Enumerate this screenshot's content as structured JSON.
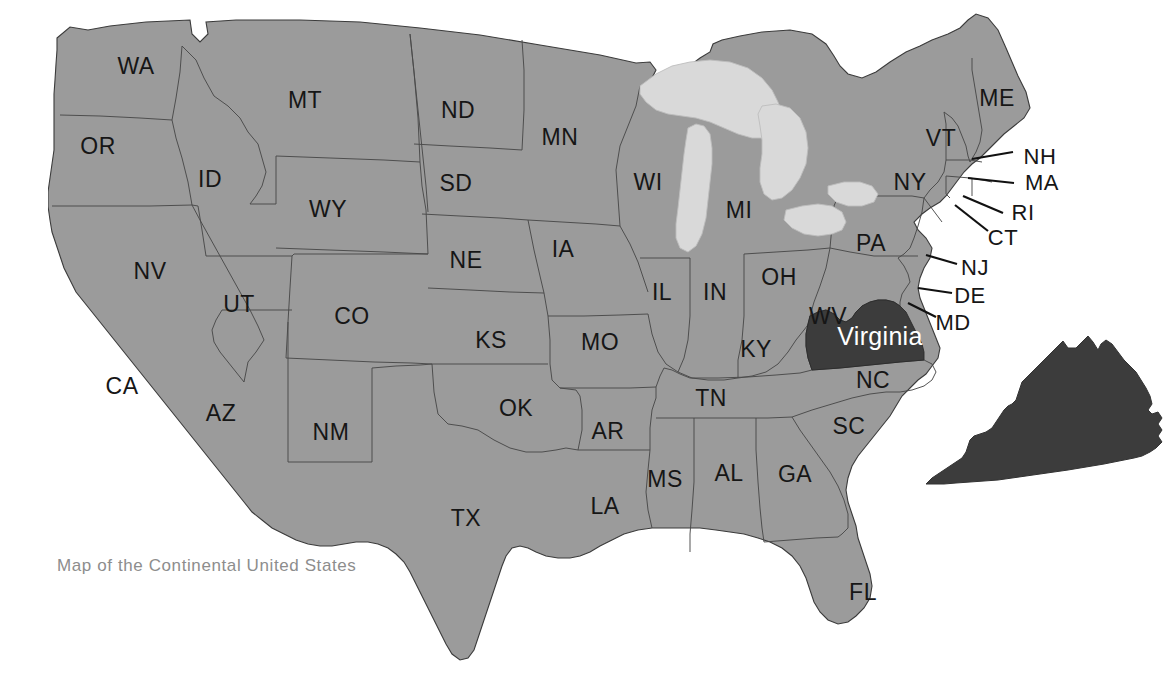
{
  "caption": {
    "text": "Map of the Continental United States",
    "x": 57,
    "y": 556
  },
  "colors": {
    "background": "#ffffff",
    "state_fill": "#9b9b9b",
    "state_border": "#4a4a4a",
    "outline": "#3b3b3b",
    "lake_fill": "#d9d9d9",
    "lake_border": "#bdbdbd",
    "highlight_fill": "#3c3c3c",
    "highlight_label": "#ffffff",
    "label_color": "#161616",
    "caption_color": "#8d8d8d",
    "leader_line": "#111111"
  },
  "highlight": {
    "state_code": "VA",
    "label": "Virginia",
    "label_x": 880,
    "label_y": 336,
    "inset_name": "virginia-inset"
  },
  "labels": [
    {
      "code": "WA",
      "x": 136,
      "y": 66
    },
    {
      "code": "OR",
      "x": 98,
      "y": 146
    },
    {
      "code": "ID",
      "x": 210,
      "y": 179
    },
    {
      "code": "MT",
      "x": 305,
      "y": 100
    },
    {
      "code": "WY",
      "x": 328,
      "y": 209
    },
    {
      "code": "ND",
      "x": 458,
      "y": 110
    },
    {
      "code": "SD",
      "x": 456,
      "y": 183
    },
    {
      "code": "NE",
      "x": 466,
      "y": 260
    },
    {
      "code": "MN",
      "x": 560,
      "y": 137
    },
    {
      "code": "IA",
      "x": 563,
      "y": 249
    },
    {
      "code": "WI",
      "x": 648,
      "y": 182
    },
    {
      "code": "MI",
      "x": 739,
      "y": 210
    },
    {
      "code": "NV",
      "x": 150,
      "y": 271
    },
    {
      "code": "UT",
      "x": 239,
      "y": 304
    },
    {
      "code": "CO",
      "x": 352,
      "y": 316
    },
    {
      "code": "KS",
      "x": 491,
      "y": 340
    },
    {
      "code": "MO",
      "x": 600,
      "y": 342
    },
    {
      "code": "IL",
      "x": 662,
      "y": 292
    },
    {
      "code": "IN",
      "x": 715,
      "y": 292
    },
    {
      "code": "OH",
      "x": 779,
      "y": 277
    },
    {
      "code": "PA",
      "x": 871,
      "y": 243
    },
    {
      "code": "NY",
      "x": 910,
      "y": 182
    },
    {
      "code": "VT",
      "x": 941,
      "y": 138
    },
    {
      "code": "ME",
      "x": 997,
      "y": 98
    },
    {
      "code": "CA",
      "x": 122,
      "y": 386
    },
    {
      "code": "AZ",
      "x": 221,
      "y": 413
    },
    {
      "code": "NM",
      "x": 331,
      "y": 432
    },
    {
      "code": "OK",
      "x": 516,
      "y": 408
    },
    {
      "code": "AR",
      "x": 608,
      "y": 431
    },
    {
      "code": "TN",
      "x": 711,
      "y": 398
    },
    {
      "code": "KY",
      "x": 756,
      "y": 349
    },
    {
      "code": "WV",
      "x": 828,
      "y": 316
    },
    {
      "code": "NC",
      "x": 873,
      "y": 380
    },
    {
      "code": "SC",
      "x": 849,
      "y": 426
    },
    {
      "code": "GA",
      "x": 795,
      "y": 474
    },
    {
      "code": "AL",
      "x": 729,
      "y": 473
    },
    {
      "code": "MS",
      "x": 665,
      "y": 479
    },
    {
      "code": "LA",
      "x": 605,
      "y": 506
    },
    {
      "code": "TX",
      "x": 466,
      "y": 518
    },
    {
      "code": "FL",
      "x": 863,
      "y": 592
    }
  ],
  "callout_labels": [
    {
      "code": "NH",
      "x": 1040,
      "y": 157,
      "line": {
        "x1": 972,
        "y1": 159,
        "x2": 1013,
        "y2": 152
      }
    },
    {
      "code": "MA",
      "x": 1042,
      "y": 183,
      "line": {
        "x1": 968,
        "y1": 178,
        "x2": 1014,
        "y2": 183
      }
    },
    {
      "code": "RI",
      "x": 1023,
      "y": 213,
      "line": {
        "x1": 963,
        "y1": 196,
        "x2": 1003,
        "y2": 213
      }
    },
    {
      "code": "CT",
      "x": 1003,
      "y": 238,
      "line": {
        "x1": 955,
        "y1": 205,
        "x2": 988,
        "y2": 231
      }
    },
    {
      "code": "NJ",
      "x": 975,
      "y": 268,
      "line": {
        "x1": 926,
        "y1": 255,
        "x2": 957,
        "y2": 264
      }
    },
    {
      "code": "DE",
      "x": 970,
      "y": 296,
      "line": {
        "x1": 918,
        "y1": 288,
        "x2": 952,
        "y2": 293
      }
    },
    {
      "code": "MD",
      "x": 953,
      "y": 323,
      "line": {
        "x1": 908,
        "y1": 303,
        "x2": 936,
        "y2": 317
      }
    }
  ],
  "regions": {
    "mainland_name": "continental-us-outline",
    "great_lakes": [
      "Lake Superior",
      "Lake Michigan",
      "Lake Huron",
      "Lake Erie",
      "Lake Ontario"
    ]
  }
}
